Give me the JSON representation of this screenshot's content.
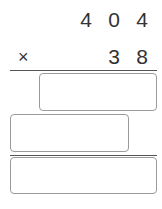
{
  "problem": {
    "multiplicand_digits": [
      "4",
      "0",
      "4"
    ],
    "multiplier_digits": [
      "3",
      "8"
    ],
    "operator": "×"
  },
  "answer_boxes": [
    {
      "label": "partial-product-1",
      "value": ""
    },
    {
      "label": "partial-product-2",
      "value": ""
    },
    {
      "label": "final-product",
      "value": ""
    }
  ]
}
